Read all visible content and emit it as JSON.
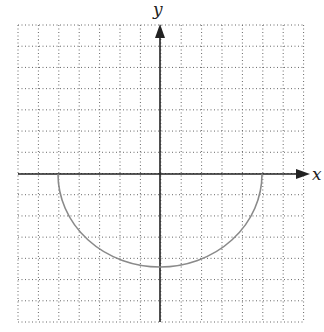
{
  "diagram": {
    "type": "coordinate-grid-graph",
    "axes": {
      "x_label": "x",
      "y_label": "y"
    },
    "grid": {
      "x_min": -7,
      "x_max": 7,
      "y_min": -7,
      "y_max": 7,
      "step": 1,
      "style": "dotted"
    },
    "curve": {
      "description": "lower semicircle",
      "x_intercepts": [
        -5,
        5
      ],
      "minimum": [
        0,
        -4.5
      ],
      "color": "#8a8a8a"
    },
    "colors": {
      "axis": "#222222",
      "grid": "#555555",
      "curve": "#8a8a8a"
    }
  }
}
